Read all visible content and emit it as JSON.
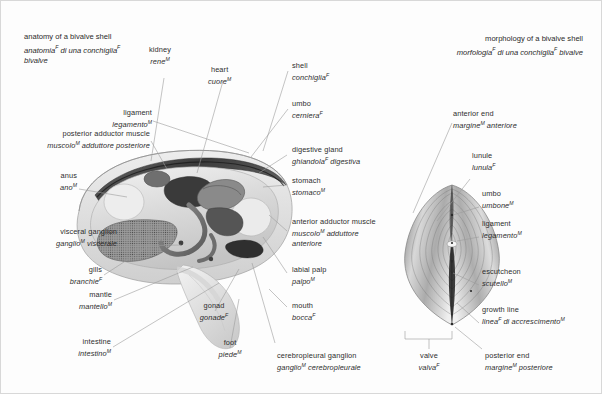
{
  "page": {
    "background": "#fdfdfd",
    "text_color": "#2d2d2d",
    "line_color": "#9a9a9a"
  },
  "titles": {
    "left": {
      "en": "anatomy of a bivalve shell",
      "it_line1": "anatomia",
      "it_sup1": "F",
      "it_line1b": " di una conchiglia",
      "it_sup2": "F",
      "it_line2": "bivalve"
    },
    "right": {
      "en": "morphology of a bivalve shell",
      "it_a": "morfologia",
      "it_sup1": "F",
      "it_b": " di una conchiglia",
      "it_sup2": "F",
      "it_c": " bivalve"
    }
  },
  "labels": {
    "kidney": {
      "en": "kidney",
      "it": "rene",
      "sup": "M"
    },
    "heart": {
      "en": "heart",
      "it": "cuore",
      "sup": "M"
    },
    "ligament": {
      "en": "ligament",
      "it": "legamento",
      "sup": "M"
    },
    "posterior_adductor": {
      "en": "posterior adductor muscle",
      "it_a": "muscolo",
      "sup": "M",
      "it_b": " adduttore posteriore"
    },
    "anus": {
      "en": "anus",
      "it": "ano",
      "sup": "M"
    },
    "visceral_ganglion": {
      "en": "visceral ganglion",
      "it_a": "ganglio",
      "sup": "M",
      "it_b": " viscerale"
    },
    "gills": {
      "en": "gills",
      "it": "branchie",
      "sup": "F"
    },
    "mantle": {
      "en": "mantle",
      "it": "mantello",
      "sup": "M"
    },
    "intestine": {
      "en": "intestine",
      "it": "intestino",
      "sup": "M"
    },
    "gonad": {
      "en": "gonad",
      "it": "gonade",
      "sup": "F"
    },
    "foot": {
      "en": "foot",
      "it": "piede",
      "sup": "M"
    },
    "cerebropleural": {
      "en": "cerebropleural ganglion",
      "it_a": "ganglio",
      "sup": "M",
      "it_b": " cerebropleurale"
    },
    "shell": {
      "en": "shell",
      "it": "conchiglia",
      "sup": "F"
    },
    "umbo_left": {
      "en": "umbo",
      "it": "cerniera",
      "sup": "F"
    },
    "digestive_gland": {
      "en": "digestive gland",
      "it_a": "ghiandola",
      "sup": "F",
      "it_b": " digestiva"
    },
    "stomach": {
      "en": "stomach",
      "it": "stomaco",
      "sup": "M"
    },
    "anterior_adductor": {
      "en": "anterior adductor muscle",
      "it_a": "muscolo",
      "sup": "M",
      "it_b": " adduttore",
      "it_c": "anteriore"
    },
    "labial_palp": {
      "en": "labial palp",
      "it": "palpo",
      "sup": "M"
    },
    "mouth": {
      "en": "mouth",
      "it": "bocca",
      "sup": "F"
    },
    "anterior_end": {
      "en": "anterior end",
      "it_a": "margine",
      "sup": "M",
      "it_b": " anteriore"
    },
    "lunule": {
      "en": "lunule",
      "it": "lunula",
      "sup": "F"
    },
    "umbo_right": {
      "en": "umbo",
      "it": "umbone",
      "sup": "M"
    },
    "ligament_right": {
      "en": "ligament",
      "it": "legamento",
      "sup": "M"
    },
    "escutcheon": {
      "en": "escutcheon",
      "it": "scutello",
      "sup": "M"
    },
    "growth_line": {
      "en": "growth line",
      "it_a": "linea",
      "sup": "F",
      "it_b": " di accrescimento",
      "sup2": "M"
    },
    "valve": {
      "en": "valve",
      "it": "valva",
      "sup": "F"
    },
    "posterior_end": {
      "en": "posterior end",
      "it_a": "margine",
      "sup": "M",
      "it_b": " posteriore"
    }
  }
}
